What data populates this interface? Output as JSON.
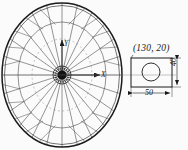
{
  "drawing": {
    "title": "Spoked wheel assembly with detail view",
    "background_color": "#fbfbfb",
    "line_color": "#2b2b2b",
    "rim_color": "#1a1a1a"
  },
  "wheel": {
    "center_x": 62,
    "center_y": 75,
    "outer_radius_x": 60,
    "outer_radius_y": 72,
    "mid_ring_radius_ratio": 0.74,
    "hub_outer_radius": 9,
    "hub_inner_radius": 4.5,
    "spoke_count": 24,
    "segment_count": 16
  },
  "axes": {
    "x_label": "X",
    "y_label": "Y",
    "x_arrow_length": 40,
    "y_arrow_length": 38
  },
  "detail": {
    "rect": {
      "x": 131,
      "y": 58,
      "width": 41,
      "height": 29
    },
    "hole": {
      "cx": 151,
      "cy": 72,
      "r": 9
    },
    "coordinate_label": "(130, 20)",
    "width_dimension": "50",
    "height_dimension": "40"
  },
  "labels": {
    "coordinate": "(130, 20)",
    "width": "50",
    "height": "40",
    "axis_x": "X",
    "axis_y": "Y"
  }
}
